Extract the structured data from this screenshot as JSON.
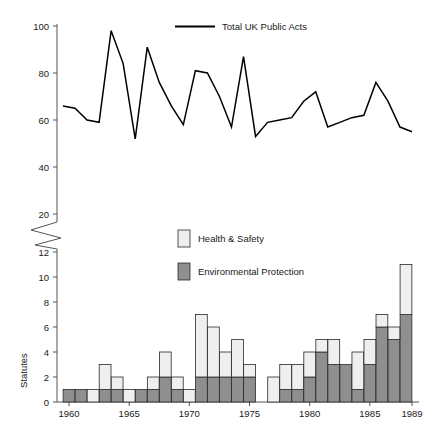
{
  "figure": {
    "name": "uk-statutes-figure",
    "background": "#ffffff"
  },
  "top_panel": {
    "legend": {
      "label": "Total UK Public Acts",
      "marker": "line",
      "color": "#000000"
    },
    "y_ticks": [
      "20",
      "40",
      "60",
      "80",
      "100"
    ],
    "axis_break": true
  },
  "bottom_panel": {
    "y_axis_title": "Statutes",
    "y_ticks": [
      "0",
      "2",
      "4",
      "6",
      "8",
      "10",
      "12"
    ],
    "x_ticks": [
      "1960",
      "1965",
      "1970",
      "1975",
      "1980",
      "1985",
      "1989"
    ],
    "legend": [
      {
        "label": "Health & Safety",
        "color": "#efefef",
        "marker": "swatch-light"
      },
      {
        "label": "Environmental Protection",
        "color": "#8f8f8f",
        "marker": "swatch-dark"
      }
    ]
  },
  "chart_data": [
    {
      "type": "line",
      "title": "",
      "panel": "top",
      "xlabel": "",
      "ylabel": "",
      "ylim": [
        20,
        100
      ],
      "xlim": [
        1960,
        1989
      ],
      "grid": false,
      "legend_position": "top-center",
      "x": [
        1960,
        1961,
        1962,
        1963,
        1964,
        1965,
        1966,
        1967,
        1968,
        1969,
        1970,
        1971,
        1972,
        1973,
        1974,
        1975,
        1976,
        1977,
        1978,
        1979,
        1980,
        1981,
        1982,
        1983,
        1984,
        1985,
        1986,
        1987,
        1988,
        1989
      ],
      "series": [
        {
          "name": "Total UK Public Acts",
          "color": "#000000",
          "values": [
            66,
            65,
            60,
            59,
            98,
            84,
            52,
            91,
            76,
            66,
            58,
            81,
            80,
            70,
            57,
            87,
            53,
            59,
            60,
            61,
            68,
            72,
            57,
            59,
            61,
            62,
            76,
            68,
            57,
            55
          ]
        }
      ]
    },
    {
      "type": "bar",
      "panel": "bottom",
      "stacked": true,
      "title": "",
      "xlabel": "",
      "ylabel": "Statutes",
      "ylim": [
        0,
        13
      ],
      "grid": false,
      "legend_position": "top-center",
      "categories": [
        1960,
        1961,
        1962,
        1963,
        1964,
        1965,
        1966,
        1967,
        1968,
        1969,
        1970,
        1971,
        1972,
        1973,
        1974,
        1975,
        1976,
        1977,
        1978,
        1979,
        1980,
        1981,
        1982,
        1983,
        1984,
        1985,
        1986,
        1987,
        1988
      ],
      "series": [
        {
          "name": "Environmental Protection",
          "color": "#8f8f8f",
          "values": [
            1,
            1,
            0,
            1,
            1,
            0,
            1,
            1,
            2,
            1,
            0,
            2,
            2,
            2,
            2,
            2,
            0,
            0,
            1,
            1,
            2,
            4,
            3,
            3,
            1,
            3,
            6,
            5,
            7
          ]
        },
        {
          "name": "Health & Safety",
          "color": "#efefef",
          "values": [
            0,
            0,
            1,
            2,
            1,
            1,
            0,
            1,
            2,
            1,
            1,
            5,
            4,
            2,
            3,
            1,
            0,
            2,
            2,
            2,
            2,
            1,
            2,
            0,
            3,
            2,
            1,
            1,
            4
          ]
        }
      ],
      "totals": [
        1,
        1,
        1,
        3,
        2,
        1,
        1,
        2,
        4,
        2,
        1,
        7,
        6,
        4,
        5,
        3,
        0,
        2,
        3,
        3,
        4,
        5,
        5,
        3,
        4,
        5,
        7,
        6,
        11
      ]
    }
  ]
}
